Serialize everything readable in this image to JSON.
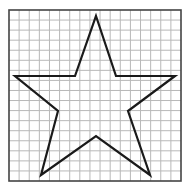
{
  "diagram": {
    "type": "star-on-grid",
    "grid": {
      "x": 9,
      "y": 10,
      "width": 172,
      "height": 171,
      "cols": 17,
      "rows": 17,
      "line_color": "#b8b8b8",
      "border_color": "#444444"
    },
    "star": {
      "points": "96,16 116,76 175,76 128,111 150,175 96,136 41,175 58,111 15,76 75,76",
      "stroke": "#1a1a1a",
      "stroke_width": 2.2
    }
  }
}
